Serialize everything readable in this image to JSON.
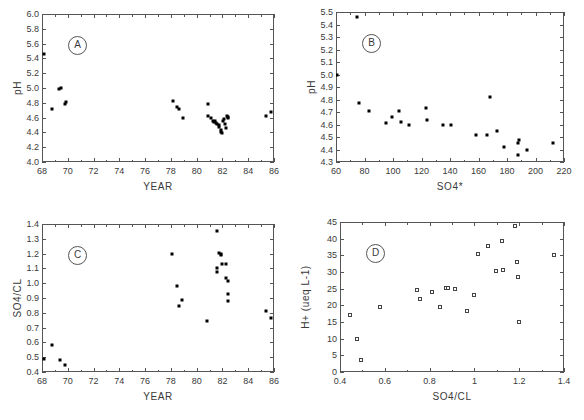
{
  "figure": {
    "background": "#ffffff",
    "marker_color": "#000000",
    "axis_color": "#555555",
    "text_color": "#3a3a3a"
  },
  "chart_data": [
    {
      "type": "scatter",
      "panel_label": "A",
      "title": "",
      "xlabel": "YEAR",
      "ylabel": "pH",
      "xlim": [
        68,
        86
      ],
      "ylim": [
        4.0,
        6.0
      ],
      "xticks": [
        68,
        70,
        72,
        74,
        76,
        78,
        80,
        82,
        84,
        86
      ],
      "xtick_labels": [
        "68",
        "70",
        "72",
        "74",
        "76",
        "78",
        "80",
        "82",
        "84",
        "86"
      ],
      "yticks": [
        4.0,
        4.2,
        4.4,
        4.6,
        4.8,
        5.0,
        5.2,
        5.4,
        5.6,
        5.8,
        6.0
      ],
      "ytick_labels": [
        "4.0",
        "4.2",
        "4.4",
        "4.6",
        "4.8",
        "5.0",
        "5.2",
        "5.4",
        "5.6",
        "5.8",
        "6.0"
      ],
      "grid": false,
      "legend": "none",
      "marker": "filled-square",
      "points": [
        [
          68.15,
          5.46
        ],
        [
          68.75,
          4.71
        ],
        [
          69.35,
          4.99
        ],
        [
          69.45,
          5.0
        ],
        [
          69.75,
          4.79
        ],
        [
          69.9,
          4.81
        ],
        [
          78.15,
          4.82
        ],
        [
          78.45,
          4.75
        ],
        [
          78.6,
          4.72
        ],
        [
          78.95,
          4.6
        ],
        [
          80.85,
          4.79
        ],
        [
          80.9,
          4.62
        ],
        [
          81.1,
          4.59
        ],
        [
          81.25,
          4.56
        ],
        [
          81.35,
          4.54
        ],
        [
          81.45,
          4.55
        ],
        [
          81.5,
          4.53
        ],
        [
          81.6,
          4.52
        ],
        [
          81.7,
          4.5
        ],
        [
          81.75,
          4.47
        ],
        [
          81.85,
          4.43
        ],
        [
          81.9,
          4.4
        ],
        [
          81.95,
          4.39
        ],
        [
          82.05,
          4.55
        ],
        [
          82.1,
          4.58
        ],
        [
          82.2,
          4.51
        ],
        [
          82.25,
          4.46
        ],
        [
          82.35,
          4.62
        ],
        [
          82.4,
          4.6
        ],
        [
          82.45,
          4.61
        ],
        [
          85.4,
          4.62
        ],
        [
          85.8,
          4.67
        ]
      ]
    },
    {
      "type": "scatter",
      "panel_label": "B",
      "title": "",
      "xlabel": "SO4*",
      "ylabel": "pH",
      "xlim": [
        60,
        220
      ],
      "ylim": [
        4.3,
        5.5
      ],
      "xticks": [
        60,
        80,
        100,
        120,
        140,
        160,
        180,
        200,
        220
      ],
      "xtick_labels": [
        "60",
        "80",
        "100",
        "120",
        "140",
        "160",
        "180",
        "200",
        "220"
      ],
      "yticks": [
        4.3,
        4.4,
        4.5,
        4.6,
        4.7,
        4.8,
        4.9,
        5.0,
        5.1,
        5.2,
        5.3,
        5.4,
        5.5
      ],
      "ytick_labels": [
        "4.3",
        "4.4",
        "4.5",
        "4.6",
        "4.7",
        "4.8",
        "4.9",
        "5.0",
        "5.1",
        "5.2",
        "5.3",
        "5.4",
        "5.5"
      ],
      "grid": false,
      "legend": "none",
      "marker": "filled-square",
      "points": [
        [
          60.5,
          5.0
        ],
        [
          74.5,
          5.46
        ],
        [
          76.0,
          4.77
        ],
        [
          83.5,
          4.71
        ],
        [
          95.0,
          4.61
        ],
        [
          99.5,
          4.66
        ],
        [
          104.0,
          4.71
        ],
        [
          105.5,
          4.62
        ],
        [
          111.0,
          4.6
        ],
        [
          123.0,
          4.73
        ],
        [
          124.0,
          4.64
        ],
        [
          135.0,
          4.6
        ],
        [
          141.0,
          4.6
        ],
        [
          158.0,
          4.52
        ],
        [
          166.0,
          4.52
        ],
        [
          168.0,
          4.82
        ],
        [
          173.0,
          4.55
        ],
        [
          178.0,
          4.42
        ],
        [
          188.0,
          4.45
        ],
        [
          188.5,
          4.48
        ],
        [
          188.0,
          4.36
        ],
        [
          194.0,
          4.4
        ],
        [
          212.0,
          4.45
        ]
      ]
    },
    {
      "type": "scatter",
      "panel_label": "C",
      "title": "",
      "xlabel": "YEAR",
      "ylabel": "SO4/CL",
      "xlim": [
        68,
        86
      ],
      "ylim": [
        0.4,
        1.4
      ],
      "xticks": [
        68,
        70,
        72,
        74,
        76,
        78,
        80,
        82,
        84,
        86
      ],
      "xtick_labels": [
        "68",
        "70",
        "72",
        "74",
        "76",
        "78",
        "80",
        "82",
        "84",
        "86"
      ],
      "yticks": [
        0.4,
        0.5,
        0.6,
        0.7,
        0.8,
        0.9,
        1.0,
        1.1,
        1.2,
        1.3,
        1.4
      ],
      "ytick_labels": [
        "0.4",
        "0.5",
        "0.6",
        "0.7",
        "0.8",
        "0.9",
        "1.0",
        "1.1",
        "1.2",
        "1.3",
        "1.4"
      ],
      "grid": false,
      "legend": "none",
      "marker": "filled-square",
      "points": [
        [
          68.15,
          0.49
        ],
        [
          68.8,
          0.585
        ],
        [
          69.4,
          0.48
        ],
        [
          69.75,
          0.445
        ],
        [
          78.1,
          1.195
        ],
        [
          78.5,
          0.978
        ],
        [
          78.6,
          0.845
        ],
        [
          78.9,
          0.888
        ],
        [
          80.8,
          0.745
        ],
        [
          81.6,
          1.355
        ],
        [
          81.55,
          1.105
        ],
        [
          81.6,
          1.075
        ],
        [
          81.75,
          1.205
        ],
        [
          81.85,
          1.2
        ],
        [
          81.9,
          1.19
        ],
        [
          82.0,
          1.13
        ],
        [
          82.3,
          1.13
        ],
        [
          82.25,
          1.035
        ],
        [
          82.4,
          1.015
        ],
        [
          82.45,
          0.925
        ],
        [
          82.4,
          0.88
        ],
        [
          85.4,
          0.815
        ],
        [
          85.75,
          0.762
        ]
      ]
    },
    {
      "type": "scatter",
      "panel_label": "D",
      "title": "",
      "xlabel": "SO4/CL",
      "ylabel": "H+ (ueq L-1)",
      "xlim": [
        0.4,
        1.4
      ],
      "ylim": [
        0,
        45
      ],
      "xticks": [
        0.4,
        0.6,
        0.8,
        1.0,
        1.2,
        1.4
      ],
      "xtick_labels": [
        "0.4",
        "0.6",
        "0.8",
        "1",
        "1.2",
        "1.4"
      ],
      "yticks": [
        0,
        5,
        10,
        15,
        20,
        25,
        30,
        35,
        40,
        45
      ],
      "ytick_labels": [
        "0",
        "5",
        "10",
        "15",
        "20",
        "25",
        "30",
        "35",
        "40",
        "45"
      ],
      "grid": false,
      "legend": "none",
      "marker": "open-square",
      "points": [
        [
          0.445,
          17.1
        ],
        [
          0.478,
          10.0
        ],
        [
          0.492,
          3.6
        ],
        [
          0.578,
          19.5
        ],
        [
          0.742,
          24.5
        ],
        [
          0.757,
          21.8
        ],
        [
          0.812,
          23.9
        ],
        [
          0.845,
          19.4
        ],
        [
          0.875,
          25.1
        ],
        [
          0.882,
          25.1
        ],
        [
          0.912,
          25.0
        ],
        [
          0.968,
          18.4
        ],
        [
          1.0,
          23.0
        ],
        [
          1.015,
          35.4
        ],
        [
          1.062,
          37.8
        ],
        [
          1.095,
          30.4
        ],
        [
          1.122,
          39.4
        ],
        [
          1.128,
          30.5
        ],
        [
          1.182,
          43.8
        ],
        [
          1.188,
          33.0
        ],
        [
          1.195,
          28.4
        ],
        [
          1.198,
          14.9
        ],
        [
          1.355,
          35.0
        ]
      ]
    }
  ]
}
